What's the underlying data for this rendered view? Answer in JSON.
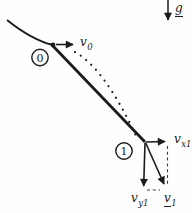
{
  "figure": {
    "colors": {
      "ink": "#1b1b1b",
      "background": "#fefefe",
      "dashed_line": "#3c3c3c"
    },
    "labels": {
      "gravity": {
        "base": "g"
      },
      "v0": {
        "base": "v",
        "sub": "0"
      },
      "vx1": {
        "base": "v",
        "sub": "x1"
      },
      "vy1": {
        "base": "v",
        "sub": "y1"
      },
      "v1": {
        "base": "v",
        "sub": "1"
      },
      "point0": "0",
      "point1": "1"
    }
  }
}
